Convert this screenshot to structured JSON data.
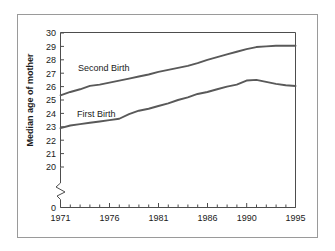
{
  "figure": {
    "background_color": "#ffffff",
    "border_color": "#9a9a9a",
    "line_color": "#595959",
    "axis_color": "#4d4d4d",
    "text_color": "#1a1a1a"
  },
  "axis_titles": {
    "y": "Median age of mother",
    "x": ""
  },
  "series_labels": {
    "second_birth": "Second Birth",
    "first_birth": "First Birth"
  },
  "y_ticks": [
    "30",
    "29",
    "28",
    "27",
    "26",
    "25",
    "24",
    "23",
    "22",
    "21",
    "20",
    "0"
  ],
  "x_ticks": [
    "1971",
    "1976",
    "1981",
    "1986",
    "1990",
    "1995"
  ],
  "chart_data": {
    "type": "line",
    "title": "",
    "subtitle": "",
    "xlabel": "",
    "ylabel": "Median age of mother",
    "xlim": [
      1971,
      1995
    ],
    "ylim": [
      20,
      30
    ],
    "y_axis_break": true,
    "y_axis_break_note": "axis broken between 0 and 20",
    "grid": false,
    "legend": "inline-labels",
    "x": [
      1971,
      1972,
      1973,
      1974,
      1975,
      1976,
      1977,
      1978,
      1979,
      1980,
      1981,
      1982,
      1983,
      1984,
      1985,
      1986,
      1987,
      1988,
      1989,
      1990,
      1991,
      1992,
      1993,
      1994,
      1995
    ],
    "categories": [
      1971,
      1972,
      1973,
      1974,
      1975,
      1976,
      1977,
      1978,
      1979,
      1980,
      1981,
      1982,
      1983,
      1984,
      1985,
      1986,
      1987,
      1988,
      1989,
      1990,
      1991,
      1992,
      1993,
      1994,
      1995
    ],
    "series": [
      {
        "name": "Second Birth",
        "label": "Second Birth",
        "color": "#595959",
        "values": [
          25.35,
          25.6,
          25.8,
          26.05,
          26.15,
          26.3,
          26.45,
          26.6,
          26.75,
          26.9,
          27.1,
          27.25,
          27.4,
          27.55,
          27.75,
          28.0,
          28.2,
          28.4,
          28.6,
          28.8,
          28.95,
          29.0,
          29.05,
          29.05,
          29.05
        ]
      },
      {
        "name": "First Birth",
        "label": "First Birth",
        "color": "#595959",
        "values": [
          22.9,
          23.1,
          23.2,
          23.3,
          23.4,
          23.5,
          23.6,
          23.95,
          24.2,
          24.35,
          24.55,
          24.75,
          25.0,
          25.2,
          25.45,
          25.6,
          25.8,
          26.0,
          26.15,
          26.45,
          26.5,
          26.35,
          26.2,
          26.1,
          26.05
        ]
      }
    ],
    "annotations": [
      {
        "text": "Second Birth",
        "x": 1974.5,
        "y": 27.1
      },
      {
        "text": "First Birth",
        "x": 1974.3,
        "y": 24.35
      }
    ]
  }
}
